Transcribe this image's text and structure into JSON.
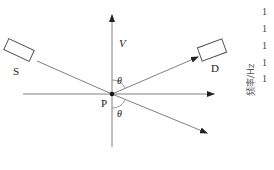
{
  "diagram": {
    "labels": {
      "source": "S",
      "detector": "D",
      "point": "P",
      "velocity": "V",
      "angle_upper": "θ",
      "angle_lower": "θ"
    },
    "colors": {
      "line": "#808080",
      "box": "#555555",
      "point": "#111111",
      "text": "#222222"
    }
  },
  "side_axis": {
    "label": "频率/Hz",
    "ticks": [
      "1",
      "1",
      "1",
      "1",
      "1"
    ]
  }
}
